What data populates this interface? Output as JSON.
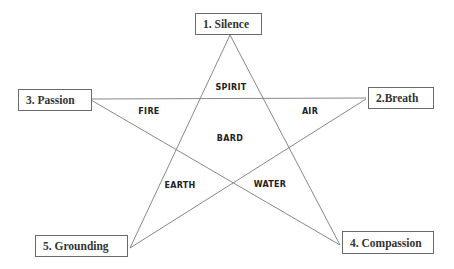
{
  "nodes": {
    "silence": "1. Silence",
    "breath": "2.Breath",
    "passion": "3. Passion",
    "compassion": "4. Compassion",
    "grounding": "5. Grounding"
  },
  "regions": {
    "spirit": "SPIRIT",
    "air": "AIR",
    "fire": "FIRE",
    "bard": "BARD",
    "earth": "EARTH",
    "water": "WATER"
  },
  "colors": {
    "line": "#7a7a7a",
    "box_border": "#6a6a6a"
  }
}
